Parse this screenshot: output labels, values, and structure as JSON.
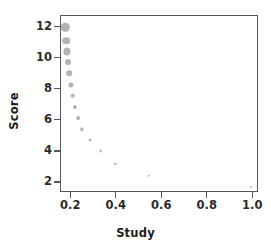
{
  "chart_data": {
    "type": "scatter",
    "title": "",
    "xlabel": "Study",
    "ylabel": "Score",
    "xlim": [
      0.155,
      1.025
    ],
    "ylim": [
      1.35,
      12.75
    ],
    "xticks": [
      0.2,
      0.4,
      0.6,
      0.8,
      1.0
    ],
    "xtick_labels": [
      "0.2",
      "0.4",
      "0.6",
      "0.8",
      "1.0"
    ],
    "yticks": [
      2,
      4,
      6,
      8,
      10,
      12
    ],
    "ytick_labels": [
      "2",
      "4",
      "6",
      "8",
      "10",
      "12"
    ],
    "grid": false,
    "legend": null,
    "marker_color": "#b3b3b5",
    "frame_color": "#58585a",
    "background_color": "#ffffff",
    "series": [
      {
        "name": "Score vs Study",
        "points": [
          {
            "x": 0.179,
            "y": 11.95,
            "size": 8.4
          },
          {
            "x": 0.182,
            "y": 11.1,
            "size": 7.6
          },
          {
            "x": 0.185,
            "y": 10.4,
            "size": 7.2
          },
          {
            "x": 0.19,
            "y": 9.75,
            "size": 6.0
          },
          {
            "x": 0.196,
            "y": 9.0,
            "size": 5.6
          },
          {
            "x": 0.203,
            "y": 8.25,
            "size": 5.2
          },
          {
            "x": 0.211,
            "y": 7.55,
            "size": 4.6
          },
          {
            "x": 0.22,
            "y": 6.82,
            "size": 4.2
          },
          {
            "x": 0.233,
            "y": 6.1,
            "size": 3.8
          },
          {
            "x": 0.252,
            "y": 5.38,
            "size": 3.4
          },
          {
            "x": 0.285,
            "y": 4.68,
            "size": 3.0
          },
          {
            "x": 0.333,
            "y": 3.97,
            "size": 2.8
          },
          {
            "x": 0.398,
            "y": 3.18,
            "size": 2.6
          },
          {
            "x": 0.545,
            "y": 2.38,
            "size": 2.4
          },
          {
            "x": 0.995,
            "y": 1.68,
            "size": 2.0
          }
        ]
      }
    ]
  }
}
